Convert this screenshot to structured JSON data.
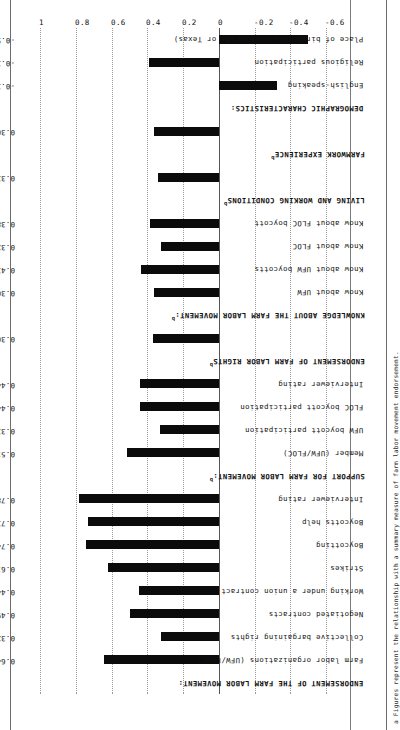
{
  "figure": {
    "orientation": "rotated-90",
    "footnote": "a Figures represent the relationship with a summary measure of farm labor movement endorsement.",
    "footnote_marker": "a",
    "section_marker": "b"
  },
  "chart_data": {
    "type": "bar",
    "title": "",
    "xlabel": "",
    "ylabel": "",
    "ylim": [
      -0.6,
      1
    ],
    "grid": true,
    "gridlines": [
      -0.6,
      -0.4,
      -0.2,
      0,
      0.2,
      0.4,
      0.6,
      0.8,
      1
    ],
    "tick_labels": [
      "-0.6",
      "-0.4",
      "-0.2",
      "0",
      "0.2",
      "0.4",
      "0.6",
      "0.8",
      "1"
    ],
    "legend": [],
    "categories": [
      "Farm labor organizations (UFW/FLOC)",
      "Collective bargaining rights",
      "Negotiated contracts",
      "Working under a union contract",
      "Strikes",
      "Boycotting",
      "Boycotts help",
      "Interviewer rating",
      "Member (UFW/FLOC)",
      "UFW boycott participation",
      "FLOC boycott participation",
      "Interviewer rating",
      "Know about UFW",
      "Know about UFW boycotts",
      "Know about FLOC",
      "Know about FLOC boycott",
      "English-speaking",
      "Religious participation",
      "Place of birth (Mexico/Florida or Texas)"
    ],
    "values": [
      0.644,
      0.325,
      0.496,
      0.447,
      0.619,
      0.741,
      0.734,
      0.784,
      0.515,
      0.331,
      0.44,
      0.44,
      0.368,
      0.365,
      0.437,
      0.323,
      0.386,
      0.338,
      -0.502
    ],
    "value_labels": [
      "0.644",
      "0.325",
      "0.496",
      "0.447",
      "0.619",
      "0.741",
      "0.734",
      "0.784",
      "0.515",
      "0.331",
      "0.440",
      "0.440",
      "0.368",
      "0.365",
      "0.437",
      "0.323",
      "0.386",
      "0.338",
      "-0.328",
      "-0.391",
      "-0.502"
    ]
  },
  "rows": [
    {
      "kind": "header",
      "label": "ENDORSEMENT OF THE FARM LABOR MOVEMENT:",
      "marker": ""
    },
    {
      "kind": "bar",
      "label": "Farm labor organizations (UFW/FLOC)",
      "value": 0.644,
      "value_label": "0.644"
    },
    {
      "kind": "bar",
      "label": "Collective bargaining rights",
      "value": 0.325,
      "value_label": "0.325"
    },
    {
      "kind": "bar",
      "label": "Negotiated contracts",
      "value": 0.496,
      "value_label": "0.496"
    },
    {
      "kind": "bar",
      "label": "Working under a union contract",
      "value": 0.447,
      "value_label": "0.447"
    },
    {
      "kind": "bar",
      "label": "Strikes",
      "value": 0.619,
      "value_label": "0.619"
    },
    {
      "kind": "bar",
      "label": "Boycotting",
      "value": 0.741,
      "value_label": "0.741"
    },
    {
      "kind": "bar",
      "label": "Boycotts help",
      "value": 0.734,
      "value_label": "0.734"
    },
    {
      "kind": "bar",
      "label": "Interviewer rating",
      "value": 0.784,
      "value_label": "0.784"
    },
    {
      "kind": "header",
      "label": "SUPPORT FOR FARM LABOR MOVEMENT:",
      "marker": "b"
    },
    {
      "kind": "bar",
      "label": "Member (UFW/FLOC)",
      "value": 0.515,
      "value_label": "0.515"
    },
    {
      "kind": "bar",
      "label": "UFW boycott participation",
      "value": 0.331,
      "value_label": "0.331"
    },
    {
      "kind": "bar",
      "label": "FLOC boycott participation",
      "value": 0.44,
      "value_label": "0.440"
    },
    {
      "kind": "bar",
      "label": "Interviewer rating",
      "value": 0.44,
      "value_label": "0.440"
    },
    {
      "kind": "header",
      "label": "ENDORSEMENT OF FARM LABOR RIGHTS",
      "marker": "b"
    },
    {
      "kind": "bar",
      "label": "",
      "value": 0.368,
      "value_label": "0.368"
    },
    {
      "kind": "header",
      "label": "KNOWLEDGE ABOUT THE FARM LABOR MOVEMENT:",
      "marker": "b"
    },
    {
      "kind": "bar",
      "label": "Know about UFW",
      "value": 0.365,
      "value_label": "0.365"
    },
    {
      "kind": "bar",
      "label": "Know about UFW boycotts",
      "value": 0.437,
      "value_label": "0.437"
    },
    {
      "kind": "bar",
      "label": "Know about FLOC",
      "value": 0.323,
      "value_label": "0.323"
    },
    {
      "kind": "bar",
      "label": "Know about FLOC boycott",
      "value": 0.386,
      "value_label": "0.386"
    },
    {
      "kind": "header",
      "label": "LIVING AND WORKING CONDITIONS",
      "marker": "b"
    },
    {
      "kind": "bar",
      "label": "",
      "value": 0.338,
      "value_label": "0.338"
    },
    {
      "kind": "header",
      "label": "FARMWORK EXPERIENCE",
      "marker": "b"
    },
    {
      "kind": "bar",
      "label": "",
      "value": 0.362,
      "value_label": "0.362"
    },
    {
      "kind": "header",
      "label": "DEMOGRAPHIC CHARACTERISTICS:",
      "marker": ""
    },
    {
      "kind": "bar",
      "label": "English-speaking",
      "value": -0.328,
      "value_label": "-0.328"
    },
    {
      "kind": "bar",
      "label": "Religious participation",
      "value": 0.391,
      "value_label": "-0.391"
    },
    {
      "kind": "bar",
      "label": "Place of birth (Mexico/Florida or Texas)",
      "value": -0.502,
      "value_label": "-0.502"
    }
  ]
}
